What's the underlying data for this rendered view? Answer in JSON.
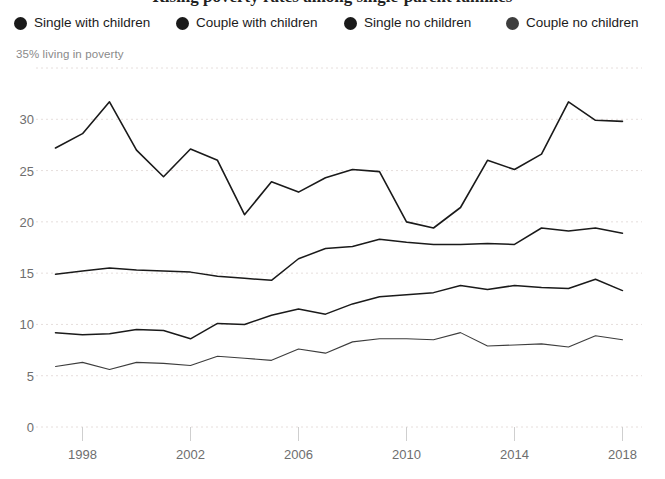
{
  "title": "Rising poverty rates among single-parent families",
  "axis_caption": "35% living in poverty",
  "legend": {
    "items": [
      {
        "label": "Single with children",
        "color": "#1a1a1a"
      },
      {
        "label": "Couple with children",
        "color": "#1a1a1a"
      },
      {
        "label": "Single no children",
        "color": "#1a1a1a"
      },
      {
        "label": "Couple no children",
        "color": "#3d3d3d"
      }
    ]
  },
  "chart_data": {
    "type": "line",
    "title": "Rising poverty rates among single-parent families",
    "xlabel": "",
    "ylabel": "35% living in poverty",
    "xlim": [
      1996.5,
      2018.5
    ],
    "ylim": [
      0,
      35
    ],
    "grid": true,
    "legend_position": "top",
    "x": [
      1997,
      1998,
      1999,
      2000,
      2001,
      2002,
      2003,
      2004,
      2005,
      2006,
      2007,
      2008,
      2009,
      2010,
      2011,
      2012,
      2013,
      2014,
      2015,
      2016,
      2017,
      2018
    ],
    "xticks": [
      1998,
      2002,
      2006,
      2010,
      2014,
      2018
    ],
    "yticks": [
      0,
      5,
      10,
      15,
      20,
      25,
      30,
      35
    ],
    "series": [
      {
        "name": "Single with children",
        "color": "#1a1a1a",
        "width": 1.6,
        "values": [
          27.2,
          28.6,
          31.7,
          27.0,
          24.4,
          27.1,
          26.0,
          20.7,
          23.9,
          22.9,
          24.3,
          25.1,
          24.9,
          20.0,
          19.4,
          21.4,
          26.0,
          25.1,
          26.6,
          31.7,
          29.9,
          29.8
        ]
      },
      {
        "name": "Couple with children",
        "color": "#1a1a1a",
        "width": 1.5,
        "values": [
          14.9,
          15.2,
          15.5,
          15.3,
          15.2,
          15.1,
          14.7,
          14.5,
          14.3,
          16.4,
          17.4,
          17.6,
          18.3,
          18.0,
          17.8,
          17.8,
          17.9,
          17.8,
          19.4,
          19.1,
          19.4,
          18.9
        ]
      },
      {
        "name": "Single no children",
        "color": "#1a1a1a",
        "width": 1.5,
        "values": [
          9.2,
          9.0,
          9.1,
          9.5,
          9.4,
          8.6,
          10.1,
          10.0,
          10.9,
          11.5,
          11.0,
          12.0,
          12.7,
          12.9,
          13.1,
          13.8,
          13.4,
          13.8,
          13.6,
          13.5,
          14.4,
          13.3
        ]
      },
      {
        "name": "Couple no children",
        "color": "#3d3d3d",
        "width": 1.1,
        "values": [
          5.9,
          6.3,
          5.6,
          6.3,
          6.2,
          6.0,
          6.9,
          6.7,
          6.5,
          7.6,
          7.2,
          8.3,
          8.6,
          8.6,
          8.5,
          9.2,
          7.9,
          8.0,
          8.1,
          7.8,
          8.9,
          8.5
        ]
      }
    ]
  },
  "colors": {
    "gridline": "#e6dedc",
    "axis_text": "#6e6e6e",
    "caption_text": "#8a8a8a",
    "line_primary": "#1a1a1a",
    "line_light": "#3d3d3d",
    "background": "#ffffff"
  }
}
